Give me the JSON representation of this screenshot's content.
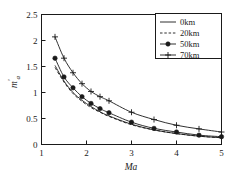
{
  "chart_data": {
    "type": "line",
    "title": "",
    "xlabel": "Ma",
    "ylabel": "m'a",
    "xlim": [
      1,
      5
    ],
    "ylim": [
      0,
      2.5
    ],
    "xticks": [
      "1",
      "2",
      "3",
      "4",
      "5"
    ],
    "yticks": [
      "0",
      "0.5",
      "1",
      "1.5",
      "2",
      "2.5"
    ],
    "grid": false,
    "legend_position": "top-right",
    "series": [
      {
        "name": "0km",
        "style": "solid",
        "marker": "none",
        "x": [
          1.3,
          1.5,
          1.7,
          1.9,
          2.1,
          2.3,
          2.5,
          3.0,
          3.5,
          4.0,
          4.5,
          5.0
        ],
        "values": [
          1.52,
          1.22,
          1.0,
          0.85,
          0.73,
          0.63,
          0.55,
          0.39,
          0.28,
          0.21,
          0.16,
          0.13
        ]
      },
      {
        "name": "20km",
        "style": "dashed",
        "marker": "none",
        "x": [
          1.3,
          1.5,
          1.7,
          1.9,
          2.1,
          2.3,
          2.5,
          3.0,
          3.5,
          4.0,
          4.5,
          5.0
        ],
        "values": [
          1.48,
          1.2,
          0.98,
          0.83,
          0.71,
          0.62,
          0.54,
          0.38,
          0.28,
          0.21,
          0.16,
          0.13
        ]
      },
      {
        "name": "50km",
        "style": "solid",
        "marker": "filled-circle",
        "x": [
          1.3,
          1.5,
          1.7,
          1.9,
          2.1,
          2.3,
          2.5,
          3.0,
          3.5,
          4.0,
          4.5,
          5.0
        ],
        "values": [
          1.66,
          1.3,
          1.09,
          0.92,
          0.79,
          0.69,
          0.61,
          0.43,
          0.31,
          0.24,
          0.18,
          0.15
        ]
      },
      {
        "name": "70km",
        "style": "solid",
        "marker": "plus",
        "x": [
          1.3,
          1.5,
          1.7,
          1.9,
          2.1,
          2.3,
          2.5,
          3.0,
          3.5,
          4.0,
          4.5,
          5.0
        ],
        "values": [
          2.07,
          1.66,
          1.38,
          1.17,
          1.02,
          0.92,
          0.84,
          0.62,
          0.48,
          0.37,
          0.3,
          0.24
        ]
      }
    ]
  },
  "legend": {
    "items": [
      {
        "label": "0km"
      },
      {
        "label": "20km"
      },
      {
        "label": "50km"
      },
      {
        "label": "70km"
      }
    ]
  },
  "axes": {
    "x_title": "Ma",
    "y_title_base": "m",
    "y_title_prime": "′",
    "y_title_sub": "a"
  },
  "colors": {
    "ink": "#1a1a1a",
    "background": "#ffffff"
  }
}
